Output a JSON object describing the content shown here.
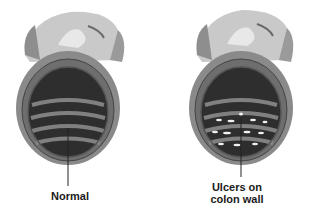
{
  "figure": {
    "type": "medical-illustration",
    "panels": [
      {
        "id": "normal",
        "label": "Normal"
      },
      {
        "id": "ulcerated",
        "label_line1": "Ulcers on",
        "label_line2": "colon wall"
      }
    ]
  },
  "colors": {
    "outer_wall": "#c9c9c9",
    "outer_highlight": "#e4e4e4",
    "wall_band": "#7a7a7a",
    "lumen_dark": "#2e2e2e",
    "lumen_ring": "#8a8a8a",
    "ulcer_spot": "#f0f0f0",
    "leader_line": "#222222"
  }
}
